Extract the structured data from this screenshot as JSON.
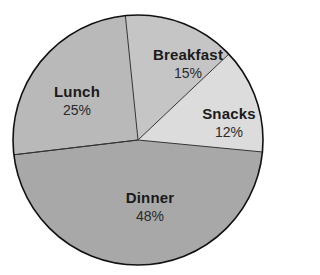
{
  "chart_data": {
    "type": "pie",
    "title": "",
    "categories": [
      "Breakfast",
      "Snacks",
      "Dinner",
      "Lunch"
    ],
    "values": [
      15,
      12,
      48,
      25
    ],
    "unit": "%",
    "labels": [
      {
        "name": "Breakfast",
        "pct": "15%"
      },
      {
        "name": "Snacks",
        "pct": "12%"
      },
      {
        "name": "Dinner",
        "pct": "48%"
      },
      {
        "name": "Lunch",
        "pct": "25%"
      }
    ],
    "colors": {
      "Breakfast": "#c5c5c5",
      "Snacks": "#dcdcdc",
      "Dinner": "#a8a8a8",
      "Lunch": "#b9b9b9"
    },
    "legend": "none (labels inside slices)"
  },
  "layout": {
    "center": [
      138,
      140
    ],
    "radius": 125,
    "slice_angles_deg": {
      "Breakfast": [
        95.8,
        43.4
      ],
      "Snacks": [
        43.4,
        -5.5
      ],
      "Dinner": [
        -5.5,
        -173.2
      ],
      "Lunch": [
        186.8,
        95.8
      ]
    },
    "label_positions": {
      "Breakfast": [
        188,
        64
      ],
      "Snacks": [
        229,
        123
      ],
      "Dinner": [
        150,
        207
      ],
      "Lunch": [
        77,
        101
      ]
    },
    "outline_color": "#111111",
    "divider_color": "#333333"
  }
}
